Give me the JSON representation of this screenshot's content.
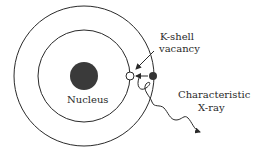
{
  "diagram": {
    "labels": {
      "nucleus": "Nucleus",
      "kshell_line1": "K-shell",
      "kshell_line2": "vacancy",
      "xray_line1": "Characteristic",
      "xray_line2": "X-ray"
    },
    "colors": {
      "stroke": "#2a2a2a",
      "nucleus": "#3a3a3a",
      "electron": "#333333",
      "vacancy_fill": "#ffffff"
    },
    "shells": [
      {
        "name": "K-shell",
        "radius": 46
      },
      {
        "name": "L-shell",
        "radius": 70
      }
    ]
  }
}
